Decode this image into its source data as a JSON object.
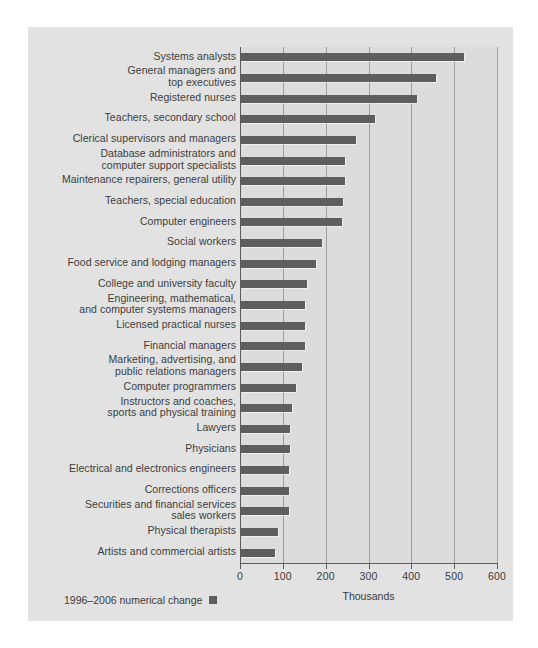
{
  "chart_data": {
    "type": "bar",
    "orientation": "horizontal",
    "title": "",
    "subtitle": "",
    "xlabel": "Thousands",
    "ylabel": "",
    "xlim": [
      0,
      600
    ],
    "xticks": [
      0,
      100,
      200,
      300,
      400,
      500,
      600
    ],
    "xtick_labels": [
      "0",
      "100",
      "200",
      "300",
      "400",
      "500",
      "600"
    ],
    "grid": "vertical",
    "legend_position": "bottom-left",
    "series": [
      {
        "name": "1996–2006 numerical change",
        "color": "#5e5e5e",
        "values": [
          520,
          455,
          411,
          312,
          268,
          243,
          242,
          239,
          235,
          188,
          176,
          155,
          150,
          149,
          149,
          142,
          129,
          120,
          115,
          114,
          111,
          111,
          111,
          87,
          79
        ]
      }
    ],
    "categories": [
      "Systems analysts",
      "General managers and\ntop executives",
      "Registered nurses",
      "Teachers, secondary school",
      "Clerical supervisors and managers",
      "Database administrators and\ncomputer support specialists",
      "Maintenance repairers, general utility",
      "Teachers, special education",
      "Computer engineers",
      "Social workers",
      "Food service and lodging managers",
      "College and university faculty",
      "Engineering, mathematical,\nand computer systems managers",
      "Licensed practical nurses",
      "Financial managers",
      "Marketing, advertising, and\npublic relations managers",
      "Computer programmers",
      "Instructors and coaches,\nsports and physical training",
      "Lawyers",
      "Physicians",
      "Electrical and electronics engineers",
      "Corrections officers",
      "Securities and financial services\nsales workers",
      "Physical therapists",
      "Artists and commercial artists"
    ]
  },
  "legend": {
    "label": "1996–2006 numerical change",
    "swatch_color": "#5e5e5e"
  },
  "axis": {
    "x_title": "Thousands"
  },
  "colors": {
    "page_background": "#ffffff",
    "panel_background": "#e2e2e2",
    "plot_background": "#dcdcdc",
    "bar": "#5e5e5e",
    "gridline": "#9d9d9d",
    "axis": "#5b5b5b",
    "text": "#3b3b3b"
  }
}
